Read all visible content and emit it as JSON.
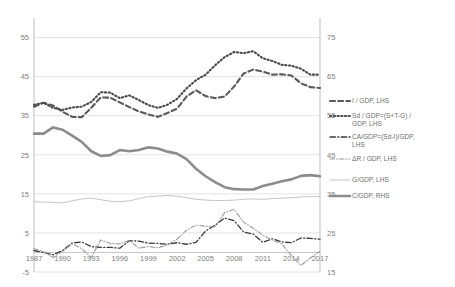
{
  "chart_data": {
    "type": "line",
    "title": "",
    "xlabel": "",
    "ylabel_left": "",
    "ylabel_right": "",
    "grid": true,
    "legend_position": "right",
    "x": [
      1987,
      1988,
      1989,
      1990,
      1991,
      1992,
      1993,
      1994,
      1995,
      1996,
      1997,
      1998,
      1999,
      2000,
      2001,
      2002,
      2003,
      2004,
      2005,
      2006,
      2007,
      2008,
      2009,
      2010,
      2011,
      2012,
      2013,
      2014,
      2015,
      2016,
      2017
    ],
    "xticks": [
      1987,
      1990,
      1993,
      1996,
      1999,
      2002,
      2005,
      2008,
      2011,
      2014,
      2017
    ],
    "left_axis": {
      "ticks": [
        -5,
        5,
        15,
        25,
        35,
        45,
        55
      ],
      "min": -5,
      "max": 60
    },
    "right_axis": {
      "ticks": [
        15,
        25,
        35,
        45,
        55,
        65,
        75
      ],
      "min": 15,
      "max": 80
    },
    "series": [
      {
        "name": "I / GDP, LHS",
        "axis": "left",
        "style": "dashed",
        "color": "#595959",
        "width": 2.1,
        "values": [
          37.3,
          38.3,
          37.6,
          36.0,
          34.7,
          34.6,
          37.0,
          39.7,
          39.6,
          38.4,
          37.2,
          36.1,
          35.3,
          34.7,
          35.7,
          36.8,
          39.9,
          41.5,
          40.0,
          39.5,
          39.9,
          42.5,
          45.8,
          46.8,
          46.3,
          45.5,
          45.6,
          45.3,
          43.3,
          42.3,
          42.1
        ]
      },
      {
        "name": "Sd / GDP=(S+T-G) / GDP, LHS",
        "axis": "left",
        "style": "dotted",
        "color": "#4a4a4a",
        "width": 2.1,
        "values": [
          37.8,
          38.3,
          37.0,
          36.5,
          37.1,
          37.3,
          38.5,
          41.0,
          40.9,
          39.5,
          40.2,
          39.0,
          37.7,
          37.0,
          37.8,
          39.3,
          42.0,
          44.1,
          45.5,
          47.9,
          50.0,
          51.3,
          51.0,
          51.5,
          49.7,
          49.0,
          48.0,
          47.8,
          47.0,
          45.5,
          45.5
        ]
      },
      {
        "name": "CA/GDP=(Sd-I)/GDP, LHS",
        "axis": "left",
        "style": "dashdot",
        "color": "#3a3a3a",
        "width": 1.3,
        "values": [
          0.5,
          0.0,
          -0.6,
          0.5,
          2.4,
          2.7,
          1.5,
          1.3,
          1.3,
          1.1,
          3.0,
          2.9,
          2.4,
          2.3,
          2.1,
          2.5,
          2.1,
          2.6,
          5.5,
          7.0,
          8.8,
          8.1,
          5.2,
          4.7,
          2.6,
          3.5,
          2.7,
          2.5,
          3.7,
          3.6,
          3.4
        ]
      },
      {
        "name": "ΔR / GDP, LHS",
        "axis": "left",
        "style": "dashdot",
        "color": "#9a9a9a",
        "width": 1.1,
        "values": [
          1.0,
          0.2,
          -1.3,
          0.3,
          2.2,
          1.0,
          -1.3,
          3.2,
          2.3,
          2.2,
          3.1,
          1.1,
          1.5,
          1.2,
          1.9,
          3.4,
          5.7,
          7.0,
          6.7,
          6.5,
          10.2,
          11.0,
          7.7,
          6.2,
          4.4,
          3.2,
          2.2,
          -0.8,
          -3.3,
          -1.4,
          0.3
        ]
      },
      {
        "name": "G/GDP, LHS",
        "axis": "left",
        "style": "solid",
        "color": "#c4c4c4",
        "width": 1.0,
        "values": [
          13.0,
          12.9,
          12.8,
          12.7,
          13.2,
          13.7,
          13.9,
          13.5,
          13.1,
          13.0,
          13.2,
          13.8,
          14.3,
          14.4,
          14.6,
          14.4,
          14.0,
          13.6,
          13.4,
          13.3,
          13.3,
          13.4,
          13.6,
          13.7,
          13.6,
          13.8,
          13.9,
          14.0,
          14.2,
          14.3,
          14.3
        ]
      },
      {
        "name": "C/GDP, RHS",
        "axis": "right",
        "style": "solid",
        "color": "#8c8c8c",
        "width": 2.6,
        "values": [
          50.4,
          50.4,
          52.0,
          51.4,
          49.9,
          48.3,
          45.9,
          44.7,
          44.9,
          46.2,
          45.9,
          46.2,
          46.9,
          46.6,
          45.8,
          45.3,
          43.9,
          41.4,
          39.5,
          38.0,
          36.7,
          36.2,
          36.1,
          36.1,
          37.0,
          37.6,
          38.2,
          38.7,
          39.6,
          39.8,
          39.5
        ]
      }
    ]
  },
  "legend": {
    "items": [
      {
        "label": "I / GDP, LHS"
      },
      {
        "label": "Sd / GDP=(S+T-G) / GDP, LHS"
      },
      {
        "label": "CA/GDP=(Sd-I)/GDP, LHS"
      },
      {
        "label": "ΔR / GDP, LHS"
      },
      {
        "label": "G/GDP, LHS"
      },
      {
        "label": "C/GDP, RHS"
      }
    ]
  }
}
